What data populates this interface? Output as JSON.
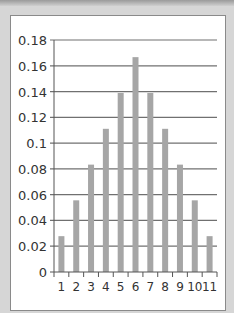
{
  "chart_data": {
    "type": "bar",
    "title": "",
    "xlabel": "",
    "ylabel": "",
    "categories": [
      "1",
      "2",
      "3",
      "4",
      "5",
      "6",
      "7",
      "8",
      "9",
      "10",
      "11"
    ],
    "values": [
      0.0278,
      0.0556,
      0.0833,
      0.1111,
      0.1389,
      0.1667,
      0.1389,
      0.1111,
      0.0833,
      0.0556,
      0.0278
    ],
    "ylim": [
      0,
      0.18
    ],
    "yticks": [
      "0",
      "0.02",
      "0.04",
      "0.06",
      "0.08",
      "0.1",
      "0.12",
      "0.14",
      "0.16",
      "0.18"
    ],
    "grid": true,
    "legend": null,
    "colors": {
      "bar": "#a6a6a6",
      "grid": "#707070",
      "axis": "#555555",
      "panel": "#ffffff",
      "background": "#d6d6d6"
    }
  }
}
